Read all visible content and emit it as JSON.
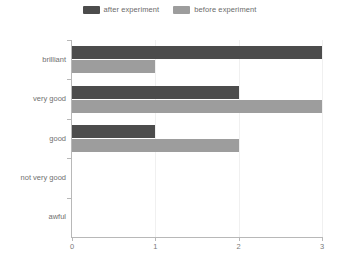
{
  "chart_data": {
    "type": "bar",
    "orientation": "horizontal",
    "title": "",
    "xlabel": "",
    "ylabel": "",
    "categories": [
      "brilliant",
      "very good",
      "good",
      "not very good",
      "awful"
    ],
    "series": [
      {
        "name": "after experiment",
        "color": "#4c4c4c",
        "values": [
          3,
          2,
          1,
          0,
          0
        ]
      },
      {
        "name": "before experiment",
        "color": "#9d9d9d",
        "values": [
          1,
          3,
          2,
          0,
          0
        ]
      }
    ],
    "xlim": [
      0,
      3
    ],
    "xticks": [
      0,
      1,
      2,
      3
    ],
    "xtick_labels": [
      "0",
      "1",
      "2",
      "3"
    ],
    "grid": true,
    "legend_position": "top-center"
  },
  "legend": {
    "entries": [
      {
        "label": "after experiment",
        "color": "#4c4c4c"
      },
      {
        "label": "before experiment",
        "color": "#9d9d9d"
      }
    ]
  },
  "axis": {
    "y_labels": [
      "brilliant",
      "very good",
      "good",
      "not very good",
      "awful"
    ],
    "x_labels": [
      "0",
      "1",
      "2",
      "3"
    ]
  },
  "caption": {
    "text": ""
  },
  "colors": {
    "after": "#4c4c4c",
    "before": "#9d9d9d",
    "axis": "#b8b8b8",
    "grid": "#f0f0f0",
    "text": "#6f6f6f",
    "background": "#ffffff"
  }
}
